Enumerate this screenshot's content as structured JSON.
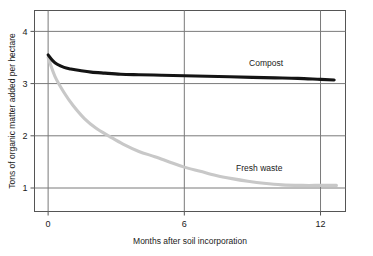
{
  "chart_data": {
    "type": "line",
    "title": "",
    "xlabel": "Months after soil incorporation",
    "ylabel": "Tons of organic matter added per hectare",
    "xlim": [
      -0.6,
      13.1
    ],
    "ylim": [
      0.55,
      4.4
    ],
    "xticks": [
      0,
      6,
      12
    ],
    "xticklabels": [
      "0",
      "6",
      "12"
    ],
    "yticks": [
      1,
      2,
      3,
      4
    ],
    "yticklabels": [
      "1",
      "2",
      "3",
      "4"
    ],
    "grid": "both",
    "legend_position": "inline-annotations",
    "series": [
      {
        "name": "Compost",
        "color": "#141414",
        "label_x": 9.6,
        "label_y": 3.33,
        "x": [
          0.0,
          0.2,
          0.4,
          0.7,
          1.0,
          1.4,
          1.9,
          2.5,
          3.2,
          4.0,
          5.0,
          6.0,
          7.0,
          8.0,
          9.0,
          10.0,
          11.0,
          12.0,
          12.6
        ],
        "y": [
          3.55,
          3.44,
          3.37,
          3.31,
          3.28,
          3.25,
          3.22,
          3.2,
          3.18,
          3.17,
          3.16,
          3.15,
          3.14,
          3.13,
          3.12,
          3.11,
          3.1,
          3.08,
          3.07
        ]
      },
      {
        "name": "Fresh waste",
        "color": "#c8c8c8",
        "label_x": 9.3,
        "label_y": 1.32,
        "x": [
          0.0,
          0.3,
          0.7,
          1.1,
          1.6,
          2.1,
          2.7,
          3.3,
          4.0,
          4.7,
          5.4,
          6.0,
          6.7,
          7.4,
          8.1,
          8.8,
          9.5,
          10.3,
          11.2,
          12.0,
          12.7
        ],
        "y": [
          3.5,
          3.14,
          2.83,
          2.58,
          2.33,
          2.15,
          1.99,
          1.84,
          1.7,
          1.6,
          1.49,
          1.4,
          1.32,
          1.24,
          1.18,
          1.13,
          1.09,
          1.06,
          1.05,
          1.05,
          1.05
        ]
      }
    ],
    "annotations": [
      {
        "text": "Compost",
        "series": "Compost"
      },
      {
        "text": "Fresh waste",
        "series": "Fresh waste"
      }
    ]
  }
}
